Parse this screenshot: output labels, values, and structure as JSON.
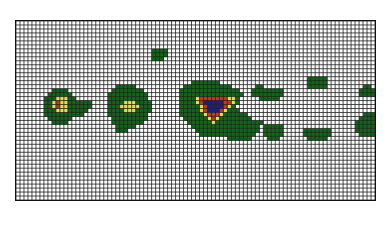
{
  "chart_data": {
    "type": "heatmap",
    "title": "",
    "xlabel": "",
    "ylabel": "",
    "grid": true,
    "cols": 90,
    "rows": 45,
    "levels": [
      {
        "value": 0,
        "color": "#ffffff"
      },
      {
        "value": 1,
        "color": "#0a6b12"
      },
      {
        "value": 2,
        "color": "#e8e23a"
      },
      {
        "value": 3,
        "color": "#c8341c"
      },
      {
        "value": 4,
        "color": "#1c1c8c"
      }
    ],
    "grid_color": "#222222",
    "runs": [
      {
        "v": 1,
        "r": 7,
        "c0": 34,
        "c1": 37
      },
      {
        "v": 1,
        "r": 8,
        "c0": 34,
        "c1": 37
      },
      {
        "v": 1,
        "r": 9,
        "c0": 34,
        "c1": 36
      },
      {
        "v": 1,
        "r": 17,
        "c0": 9,
        "c1": 12
      },
      {
        "v": 1,
        "r": 18,
        "c0": 8,
        "c1": 13
      },
      {
        "v": 1,
        "r": 19,
        "c0": 7,
        "c1": 14
      },
      {
        "v": 1,
        "r": 20,
        "c0": 7,
        "c1": 18
      },
      {
        "v": 1,
        "r": 21,
        "c0": 7,
        "c1": 18
      },
      {
        "v": 1,
        "r": 22,
        "c0": 7,
        "c1": 17
      },
      {
        "v": 1,
        "r": 23,
        "c0": 7,
        "c1": 16
      },
      {
        "v": 1,
        "r": 24,
        "c0": 8,
        "c1": 13
      },
      {
        "v": 1,
        "r": 25,
        "c0": 9,
        "c1": 12
      },
      {
        "v": 2,
        "r": 19,
        "c0": 10,
        "c1": 12
      },
      {
        "v": 2,
        "r": 20,
        "c0": 9,
        "c1": 12
      },
      {
        "v": 2,
        "r": 21,
        "c0": 9,
        "c1": 12
      },
      {
        "v": 2,
        "r": 22,
        "c0": 10,
        "c1": 12
      },
      {
        "v": 3,
        "r": 21,
        "c0": 10,
        "c1": 10
      },
      {
        "v": 3,
        "r": 20,
        "c0": 10,
        "c1": 10
      },
      {
        "v": 1,
        "r": 16,
        "c0": 25,
        "c1": 29
      },
      {
        "v": 1,
        "r": 17,
        "c0": 24,
        "c1": 31
      },
      {
        "v": 1,
        "r": 18,
        "c0": 23,
        "c1": 32
      },
      {
        "v": 1,
        "r": 19,
        "c0": 23,
        "c1": 32
      },
      {
        "v": 1,
        "r": 20,
        "c0": 23,
        "c1": 33
      },
      {
        "v": 1,
        "r": 21,
        "c0": 23,
        "c1": 33
      },
      {
        "v": 1,
        "r": 22,
        "c0": 23,
        "c1": 33
      },
      {
        "v": 1,
        "r": 23,
        "c0": 23,
        "c1": 32
      },
      {
        "v": 1,
        "r": 24,
        "c0": 24,
        "c1": 32
      },
      {
        "v": 1,
        "r": 25,
        "c0": 24,
        "c1": 31
      },
      {
        "v": 1,
        "r": 26,
        "c0": 25,
        "c1": 29
      },
      {
        "v": 1,
        "r": 27,
        "c0": 25,
        "c1": 27
      },
      {
        "v": 2,
        "r": 20,
        "c0": 27,
        "c1": 29
      },
      {
        "v": 2,
        "r": 21,
        "c0": 26,
        "c1": 30
      },
      {
        "v": 2,
        "r": 22,
        "c0": 27,
        "c1": 29
      },
      {
        "v": 1,
        "r": 15,
        "c0": 44,
        "c1": 50
      },
      {
        "v": 1,
        "r": 16,
        "c0": 42,
        "c1": 53
      },
      {
        "v": 1,
        "r": 17,
        "c0": 41,
        "c1": 55
      },
      {
        "v": 1,
        "r": 18,
        "c0": 41,
        "c1": 56
      },
      {
        "v": 1,
        "r": 19,
        "c0": 41,
        "c1": 55
      },
      {
        "v": 1,
        "r": 20,
        "c0": 41,
        "c1": 55
      },
      {
        "v": 1,
        "r": 21,
        "c0": 41,
        "c1": 54
      },
      {
        "v": 1,
        "r": 22,
        "c0": 41,
        "c1": 55
      },
      {
        "v": 1,
        "r": 23,
        "c0": 41,
        "c1": 57
      },
      {
        "v": 1,
        "r": 24,
        "c0": 42,
        "c1": 58
      },
      {
        "v": 1,
        "r": 25,
        "c0": 43,
        "c1": 58
      },
      {
        "v": 1,
        "r": 26,
        "c0": 44,
        "c1": 60
      },
      {
        "v": 1,
        "r": 27,
        "c0": 45,
        "c1": 60
      },
      {
        "v": 1,
        "r": 28,
        "c0": 46,
        "c1": 59
      },
      {
        "v": 1,
        "r": 29,
        "c0": 53,
        "c1": 58
      },
      {
        "v": 2,
        "r": 19,
        "c0": 45,
        "c1": 54
      },
      {
        "v": 2,
        "r": 20,
        "c0": 45,
        "c1": 54
      },
      {
        "v": 2,
        "r": 21,
        "c0": 46,
        "c1": 53
      },
      {
        "v": 2,
        "r": 22,
        "c0": 46,
        "c1": 52
      },
      {
        "v": 2,
        "r": 23,
        "c0": 47,
        "c1": 51
      },
      {
        "v": 2,
        "r": 24,
        "c0": 48,
        "c1": 50
      },
      {
        "v": 2,
        "r": 25,
        "c0": 49,
        "c1": 49
      },
      {
        "v": 3,
        "r": 19,
        "c0": 46,
        "c1": 52
      },
      {
        "v": 3,
        "r": 20,
        "c0": 46,
        "c1": 53
      },
      {
        "v": 3,
        "r": 21,
        "c0": 47,
        "c1": 52
      },
      {
        "v": 3,
        "r": 22,
        "c0": 47,
        "c1": 51
      },
      {
        "v": 3,
        "r": 23,
        "c0": 48,
        "c1": 50
      },
      {
        "v": 3,
        "r": 24,
        "c0": 49,
        "c1": 49
      },
      {
        "v": 4,
        "r": 20,
        "c0": 47,
        "c1": 51
      },
      {
        "v": 4,
        "r": 21,
        "c0": 48,
        "c1": 51
      },
      {
        "v": 4,
        "r": 22,
        "c0": 48,
        "c1": 50
      },
      {
        "v": 1,
        "r": 16,
        "c0": 60,
        "c1": 61
      },
      {
        "v": 1,
        "r": 17,
        "c0": 59,
        "c1": 66
      },
      {
        "v": 1,
        "r": 18,
        "c0": 59,
        "c1": 66
      },
      {
        "v": 1,
        "r": 19,
        "c0": 61,
        "c1": 65
      },
      {
        "v": 1,
        "r": 14,
        "c0": 73,
        "c1": 77
      },
      {
        "v": 1,
        "r": 15,
        "c0": 73,
        "c1": 77
      },
      {
        "v": 1,
        "r": 16,
        "c0": 73,
        "c1": 77
      },
      {
        "v": 1,
        "r": 25,
        "c0": 58,
        "c1": 61
      },
      {
        "v": 1,
        "r": 26,
        "c0": 62,
        "c1": 66
      },
      {
        "v": 1,
        "r": 27,
        "c0": 62,
        "c1": 66
      },
      {
        "v": 1,
        "r": 28,
        "c0": 62,
        "c1": 66
      },
      {
        "v": 1,
        "r": 29,
        "c0": 63,
        "c1": 65
      },
      {
        "v": 1,
        "r": 27,
        "c0": 72,
        "c1": 78
      },
      {
        "v": 1,
        "r": 28,
        "c0": 72,
        "c1": 78
      },
      {
        "v": 1,
        "r": 29,
        "c0": 73,
        "c1": 77
      },
      {
        "v": 1,
        "r": 16,
        "c0": 87,
        "c1": 88
      },
      {
        "v": 1,
        "r": 17,
        "c0": 86,
        "c1": 89
      },
      {
        "v": 1,
        "r": 18,
        "c0": 86,
        "c1": 89
      },
      {
        "v": 1,
        "r": 23,
        "c0": 87,
        "c1": 89
      },
      {
        "v": 1,
        "r": 24,
        "c0": 86,
        "c1": 89
      },
      {
        "v": 1,
        "r": 25,
        "c0": 85,
        "c1": 89
      },
      {
        "v": 1,
        "r": 26,
        "c0": 85,
        "c1": 89
      },
      {
        "v": 1,
        "r": 27,
        "c0": 85,
        "c1": 89
      },
      {
        "v": 1,
        "r": 28,
        "c0": 86,
        "c1": 89
      }
    ]
  }
}
